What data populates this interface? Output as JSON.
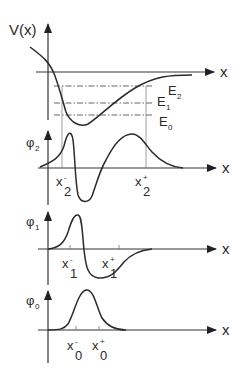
{
  "figure": {
    "potential_panel": {
      "y_label": "V(x)",
      "x_label": "x",
      "energy_levels": [
        {
          "name": "E",
          "sub": "0"
        },
        {
          "name": "E",
          "sub": "1"
        },
        {
          "name": "E",
          "sub": "2"
        }
      ]
    },
    "wavefunction_panels": [
      {
        "y_label": "φ",
        "y_sub": "2",
        "x_label": "x",
        "turning_points": [
          {
            "name": "x",
            "sub": "2",
            "sup": "-"
          },
          {
            "name": "x",
            "sub": "2",
            "sup": "+"
          }
        ]
      },
      {
        "y_label": "φ",
        "y_sub": "1",
        "x_label": "x",
        "turning_points": [
          {
            "name": "x",
            "sub": "1",
            "sup": "-"
          },
          {
            "name": "x",
            "sub": "1",
            "sup": "+"
          }
        ]
      },
      {
        "y_label": "φ",
        "y_sub": "0",
        "x_label": "x",
        "turning_points": [
          {
            "name": "x",
            "sub": "0",
            "sup": "-"
          },
          {
            "name": "x",
            "sub": "0",
            "sup": "+"
          }
        ]
      }
    ]
  },
  "colors": {
    "line": "#2b2b2b",
    "background": "#ffffff"
  }
}
